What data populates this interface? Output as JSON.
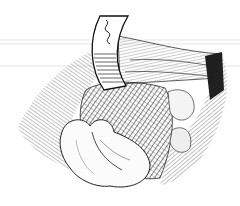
{
  "image": {
    "kind": "pen-and-ink surgical illustration",
    "description": "Curved retractor holding back layered tissue, exposing a cross-hatched organ with folded tissue in the foreground",
    "colors": {
      "background": "#ffffff",
      "ink": "#1a1a1a",
      "shade": "#3a3a3a",
      "scan_line": "#e6e6e6"
    },
    "elements": [
      "retractor",
      "upper-muscle-layer",
      "hatched-organ",
      "folded-tissue",
      "left-tissue-edge",
      "right-tissue-edge"
    ]
  }
}
